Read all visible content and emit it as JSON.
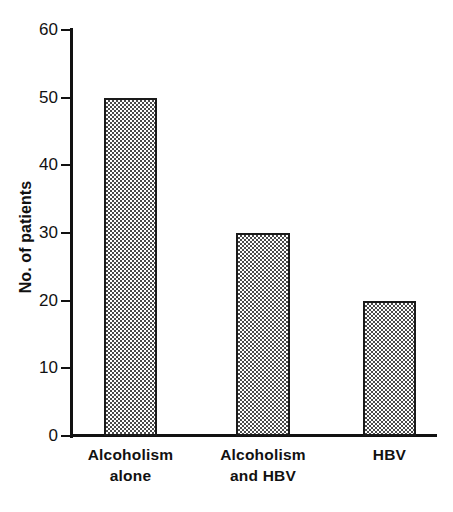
{
  "chart_data": {
    "type": "bar",
    "title": "",
    "subtitle": "",
    "xlabel": "",
    "ylabel": "No. of patients",
    "categories": [
      "Alcoholism alone",
      "Alcoholism and HBV",
      "HBV"
    ],
    "category_lines": [
      [
        "Alcoholism",
        "alone"
      ],
      [
        "Alcoholism",
        "and HBV"
      ],
      [
        "HBV",
        ""
      ]
    ],
    "values": [
      50,
      30,
      20
    ],
    "ylim": [
      0,
      60
    ],
    "ytick_values": [
      0,
      10,
      20,
      30,
      40,
      50,
      60
    ],
    "ytick_labels": [
      "0",
      "10",
      "20",
      "30",
      "40",
      "50",
      "60"
    ],
    "grid": false,
    "legend": false,
    "legend_position": "none",
    "bar_fill": "checkered-hatch",
    "colors": {
      "axis": "#111111",
      "bar_border": "#1a1a1a",
      "bar_fill_dark": "#4a4a4a",
      "bar_fill_light": "#ffffff",
      "text": "#111111",
      "background": "#ffffff"
    }
  }
}
